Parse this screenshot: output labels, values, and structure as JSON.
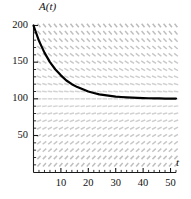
{
  "chart_data": {
    "type": "line",
    "title": "",
    "subtitle": "",
    "xlabel": "t",
    "ylabel": "A(t)",
    "xlim": [
      0,
      52
    ],
    "ylim": [
      0,
      210
    ],
    "grid": false,
    "legend": "none",
    "xticks": [
      10,
      20,
      30,
      40,
      50
    ],
    "xtick_labels": [
      "10",
      "20",
      "30",
      "40",
      "50"
    ],
    "xminor_step": 2,
    "yticks": [
      50,
      100,
      150,
      200
    ],
    "ytick_labels": [
      "50",
      "100",
      "150",
      "200"
    ],
    "yminor_step": 10,
    "annotations": [],
    "series": [
      {
        "name": "A(t)",
        "color": "#000000",
        "linewidth": 2.2,
        "description": "exponential decay solution approaching equilibrium A=100",
        "formula": "A(t) = 100 + 100*exp(-0.115*t)",
        "x": [
          0,
          2,
          4,
          6,
          8,
          10,
          12,
          14,
          16,
          18,
          20,
          22,
          24,
          26,
          28,
          30,
          32,
          34,
          36,
          38,
          40,
          42,
          44,
          46,
          48,
          50,
          52
        ],
        "y": [
          200,
          179,
          163,
          150,
          140,
          132,
          125,
          120,
          116,
          113,
          110,
          108,
          106,
          105,
          104,
          103,
          102.5,
          102,
          101.6,
          101.3,
          101,
          100.8,
          100.6,
          100.5,
          100.4,
          100.3,
          100.3
        ]
      }
    ],
    "slope_field": {
      "description": "direction field of dA/dt = -k(A - 100); marks slope downward above A=100, horizontal at A=100, upward below A=100",
      "equilibrium": 100,
      "color": "#d8d8d8",
      "x_start": 2,
      "x_step": 2,
      "x_end": 52,
      "y_start": 10,
      "y_step": 10,
      "y_end": 205
    }
  },
  "axis": {
    "y_axis_label": "A(t)",
    "x_axis_label": "t"
  }
}
